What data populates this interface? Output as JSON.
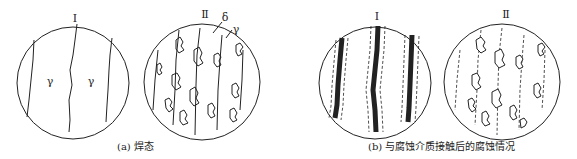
{
  "figure": {
    "panels": [
      {
        "id": "a",
        "caption": "(a) 焊态",
        "views": [
          {
            "label": "Ⅰ",
            "phases": [
              "γ",
              "γ"
            ]
          },
          {
            "label": "Ⅱ",
            "phases": [
              "δ",
              "γ"
            ]
          }
        ]
      },
      {
        "id": "b",
        "caption": "(b) 与腐蚀介质接触后的腐蚀情况",
        "views": [
          {
            "label": "Ⅰ"
          },
          {
            "label": "Ⅱ"
          }
        ]
      }
    ]
  },
  "colors": {
    "line": "#222222",
    "background": "#ffffff"
  }
}
